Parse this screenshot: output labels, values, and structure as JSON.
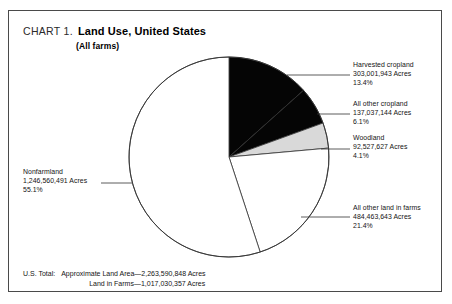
{
  "header": {
    "chart_label": "CHART 1.",
    "title": "Land Use, United States",
    "subtitle": "(All farms)"
  },
  "chart_data": {
    "type": "pie",
    "title": "Land Use, United States",
    "subtitle": "(All farms)",
    "unit": "Acres",
    "total_percent": 100.1,
    "start_angle_deg": 0,
    "direction": "clockwise",
    "categories": [
      "Harvested cropland",
      "All other cropland",
      "Woodland",
      "All other land in farms",
      "Nonfarmland"
    ],
    "values": [
      303001943,
      137037144,
      92527627,
      484463643,
      1246560491
    ],
    "percents": [
      13.4,
      6.1,
      4.1,
      21.4,
      55.1
    ],
    "colors": [
      "#050505",
      "#050505",
      "#d9d9d9",
      "#ffffff",
      "#ffffff"
    ],
    "slices": [
      {
        "name": "Harvested cropland",
        "acres_text": "303,001,943 Acres",
        "percent_text": "13.4%",
        "value": 303001943,
        "percent": 13.4,
        "color": "#050505"
      },
      {
        "name": "All other cropland",
        "acres_text": "137,037,144 Acres",
        "percent_text": "6.1%",
        "value": 137037144,
        "percent": 6.1,
        "color": "#050505"
      },
      {
        "name": "Woodland",
        "acres_text": "92,527,627 Acres",
        "percent_text": "4.1%",
        "value": 92527627,
        "percent": 4.1,
        "color": "#d9d9d9"
      },
      {
        "name": "All other land in farms",
        "acres_text": "484,463,643 Acres",
        "percent_text": "21.4%",
        "value": 484463643,
        "percent": 21.4,
        "color": "#ffffff"
      },
      {
        "name": "Nonfarmland",
        "acres_text": "1,246,560,491 Acres",
        "percent_text": "55.1%",
        "value": 1246560491,
        "percent": 55.1,
        "color": "#ffffff"
      }
    ]
  },
  "footer": {
    "total_label": "U.S. Total:",
    "line1": "Approximate Land Area—2,263,590,848 Acres",
    "line2": "Land in Farms—1,017,030,357 Acres"
  }
}
